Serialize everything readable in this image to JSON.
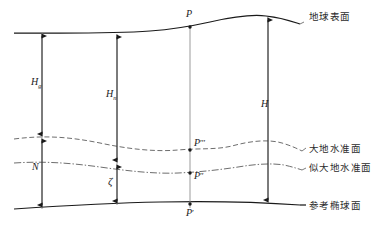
{
  "diagram": {
    "colors": {
      "surface_line": "#1a1a1a",
      "ellipsoid_line": "#1a1a1a",
      "geoid_line": "#6e6e6e",
      "quasigeoid_line": "#6e6e6e",
      "vertical_line": "#8a8a8a",
      "arrow": "#1a1a1a",
      "text": "#2b2b2b",
      "background": "#ffffff"
    },
    "surfaces": [
      {
        "id": "earth-surface",
        "label": "地球表面",
        "style": "solid",
        "label_x": 307,
        "label_y": 15
      },
      {
        "id": "geoid",
        "label": "大地水准面",
        "style": "dashed",
        "label_x": 307,
        "label_y": 145
      },
      {
        "id": "quasi-geoid",
        "label": "似大地水准面",
        "style": "dash-dot",
        "label_x": 307,
        "label_y": 165
      },
      {
        "id": "reference-ellipsoid",
        "label": "参考椭球面",
        "style": "solid",
        "label_x": 307,
        "label_y": 203
      }
    ],
    "points": [
      {
        "id": "P",
        "label": "P",
        "primes": "",
        "x": 190,
        "y": 27,
        "label_x": 186,
        "label_y": 10,
        "on": "earth-surface"
      },
      {
        "id": "P3prime",
        "label": "P",
        "primes": "′′′",
        "x": 190,
        "y": 148,
        "label_x": 194,
        "label_y": 139,
        "on": "geoid"
      },
      {
        "id": "P2prime",
        "label": "P",
        "primes": "′′",
        "x": 190,
        "y": 172,
        "label_x": 194,
        "label_y": 172,
        "on": "quasi-geoid"
      },
      {
        "id": "P1prime",
        "label": "P",
        "primes": "′",
        "x": 190,
        "y": 208,
        "label_x": 186,
        "label_y": 209,
        "on": "reference-ellipsoid"
      }
    ],
    "measures": [
      {
        "id": "Hg",
        "symbol": "H",
        "subscript": "g",
        "name": "orthometric-height",
        "x": 42,
        "label_x": 31,
        "label_y": 78,
        "from_y": 33,
        "to_y": 137
      },
      {
        "id": "Hn",
        "symbol": "H",
        "subscript": "n",
        "name": "normal-height",
        "x": 117,
        "label_x": 106,
        "label_y": 90,
        "from_y": 34,
        "to_y": 163
      },
      {
        "id": "H",
        "symbol": "H",
        "subscript": "",
        "name": "geodetic-height",
        "x": 268,
        "label_x": 261,
        "label_y": 100,
        "from_y": 18,
        "to_y": 203
      },
      {
        "id": "N",
        "symbol": "N",
        "subscript": "",
        "name": "geoid-undulation",
        "x": 42,
        "label_x": 32,
        "label_y": 163,
        "from_y": 137,
        "to_y": 200
      },
      {
        "id": "zeta",
        "symbol": "ζ",
        "subscript": "",
        "name": "height-anomaly",
        "x": 117,
        "label_x": 108,
        "label_y": 177,
        "from_y": 163,
        "to_y": 201
      }
    ]
  }
}
